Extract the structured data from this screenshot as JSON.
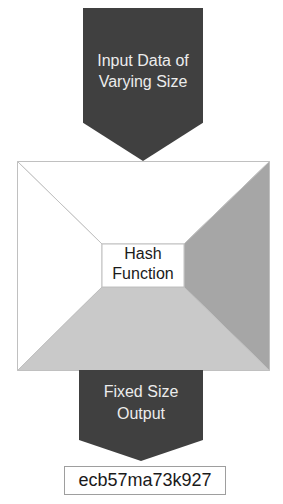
{
  "diagram": {
    "input_arrow": {
      "line1": "Input Data of",
      "line2": "Varying Size"
    },
    "hash_box": {
      "line1": "Hash",
      "line2": "Function"
    },
    "output_arrow": {
      "line1": "Fixed Size",
      "line2": "Output"
    },
    "output_value": "ecb57ma73k927",
    "colors": {
      "arrow_fill": "#404040",
      "arrow_text": "#ececec",
      "right_face": "#a6a6a6",
      "bottom_face": "#c9c9c9",
      "edge_line": "#c0c0c0",
      "box_border": "#9e9e9e",
      "text": "#1a1a1a"
    }
  }
}
